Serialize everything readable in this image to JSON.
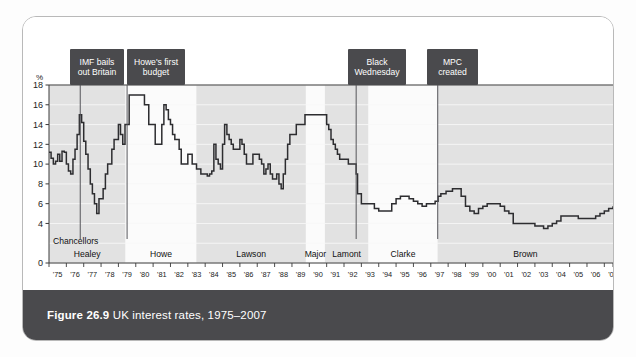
{
  "figure": {
    "number": "Figure 26.9",
    "caption": "UK interest rates, 1975–2007"
  },
  "axis": {
    "y_unit": "%",
    "y_ticks": [
      "18",
      "16",
      "14",
      "12",
      "10",
      "8",
      "6",
      "4",
      "0"
    ],
    "x_ticks": [
      "'75",
      "'76",
      "'77",
      "'78",
      "'79",
      "'80",
      "'81",
      "'82",
      "'83",
      "'84",
      "'85",
      "'86",
      "'87",
      "'88",
      "'89",
      "'90",
      "'91",
      "'92",
      "'93",
      "'94",
      "'95",
      "'96",
      "'97",
      "'98",
      "'99",
      "'00",
      "'01",
      "'02",
      "'03",
      "'04",
      "'05",
      "'06",
      "'07"
    ]
  },
  "chancellors_label": "Chancellors",
  "chancellors": [
    {
      "name": "Healey",
      "start": 1975.0,
      "end": 1979.4
    },
    {
      "name": "Howe",
      "start": 1979.4,
      "end": 1983.5
    },
    {
      "name": "Lawson",
      "start": 1983.5,
      "end": 1989.8
    },
    {
      "name": "Major",
      "start": 1989.8,
      "end": 1990.9
    },
    {
      "name": "Lamont",
      "start": 1990.9,
      "end": 1993.4
    },
    {
      "name": "Clarke",
      "start": 1993.4,
      "end": 1997.4
    },
    {
      "name": "Brown",
      "start": 1997.4,
      "end": 2007.5
    }
  ],
  "annotations": [
    {
      "text": "IMF bails\nout Britain",
      "x": 1976.8,
      "box_x": 47,
      "box_y": 32,
      "box_w": 54,
      "box_h": 36
    },
    {
      "text": "Howe's first\nbudget",
      "x": 1979.5,
      "box_x": 104,
      "box_y": 32,
      "box_w": 58,
      "box_h": 36
    },
    {
      "text": "Black\nWednesday",
      "x": 1992.7,
      "box_x": 325,
      "box_y": 32,
      "box_w": 58,
      "box_h": 36
    },
    {
      "text": "MPC\ncreated",
      "x": 1997.4,
      "box_x": 404,
      "box_y": 32,
      "box_w": 51,
      "box_h": 36
    }
  ],
  "colors": {
    "line": "#2d2d30",
    "callout_bg": "#4a4a4d",
    "caption_bg": "#4a4a4d",
    "band_light": "#fbfbfb",
    "band_dark": "#e2e2e2",
    "plot_bg": "#ebebeb",
    "grid": "#f7f7f7",
    "axis": "#3a3a3a"
  },
  "chart_data": {
    "type": "line",
    "title": "UK interest rates, 1975–2007",
    "xlabel": "",
    "ylabel": "%",
    "xlim": [
      1975.0,
      2007.5
    ],
    "ylim": [
      0,
      18
    ],
    "grid": true,
    "legend": "none",
    "step": true,
    "series": [
      {
        "name": "UK base interest rate",
        "points": [
          [
            1975.0,
            11.2
          ],
          [
            1975.12,
            10.6
          ],
          [
            1975.25,
            10.0
          ],
          [
            1975.38,
            10.3
          ],
          [
            1975.5,
            11.0
          ],
          [
            1975.62,
            10.3
          ],
          [
            1975.75,
            11.3
          ],
          [
            1975.88,
            11.2
          ],
          [
            1976.0,
            10.0
          ],
          [
            1976.12,
            9.3
          ],
          [
            1976.25,
            9.0
          ],
          [
            1976.38,
            10.5
          ],
          [
            1976.5,
            11.5
          ],
          [
            1976.62,
            13.0
          ],
          [
            1976.75,
            15.0
          ],
          [
            1976.88,
            14.2
          ],
          [
            1977.0,
            12.3
          ],
          [
            1977.12,
            11.0
          ],
          [
            1977.25,
            9.5
          ],
          [
            1977.38,
            8.0
          ],
          [
            1977.5,
            7.0
          ],
          [
            1977.62,
            6.0
          ],
          [
            1977.75,
            5.0
          ],
          [
            1977.88,
            6.5
          ],
          [
            1978.0,
            6.5
          ],
          [
            1978.12,
            7.5
          ],
          [
            1978.25,
            9.0
          ],
          [
            1978.38,
            10.0
          ],
          [
            1978.5,
            10.0
          ],
          [
            1978.62,
            11.5
          ],
          [
            1978.75,
            12.5
          ],
          [
            1978.88,
            12.5
          ],
          [
            1979.0,
            14.0
          ],
          [
            1979.12,
            13.0
          ],
          [
            1979.25,
            12.0
          ],
          [
            1979.38,
            14.0
          ],
          [
            1979.5,
            14.0
          ],
          [
            1979.62,
            17.0
          ],
          [
            1979.75,
            17.0
          ],
          [
            1979.88,
            17.0
          ],
          [
            1980.0,
            17.0
          ],
          [
            1980.25,
            17.0
          ],
          [
            1980.5,
            16.0
          ],
          [
            1980.75,
            14.0
          ],
          [
            1981.0,
            14.0
          ],
          [
            1981.12,
            12.0
          ],
          [
            1981.25,
            12.0
          ],
          [
            1981.38,
            12.0
          ],
          [
            1981.5,
            14.0
          ],
          [
            1981.62,
            16.0
          ],
          [
            1981.75,
            15.5
          ],
          [
            1981.88,
            14.5
          ],
          [
            1982.0,
            14.0
          ],
          [
            1982.12,
            13.0
          ],
          [
            1982.25,
            12.5
          ],
          [
            1982.38,
            12.5
          ],
          [
            1982.5,
            11.5
          ],
          [
            1982.62,
            10.0
          ],
          [
            1982.75,
            10.0
          ],
          [
            1982.88,
            10.0
          ],
          [
            1983.0,
            11.0
          ],
          [
            1983.25,
            10.0
          ],
          [
            1983.5,
            9.5
          ],
          [
            1983.75,
            9.0
          ],
          [
            1984.0,
            9.0
          ],
          [
            1984.12,
            8.8
          ],
          [
            1984.25,
            9.0
          ],
          [
            1984.38,
            9.3
          ],
          [
            1984.5,
            12.0
          ],
          [
            1984.62,
            10.5
          ],
          [
            1984.75,
            10.0
          ],
          [
            1984.88,
            9.5
          ],
          [
            1985.0,
            12.0
          ],
          [
            1985.12,
            14.0
          ],
          [
            1985.25,
            13.0
          ],
          [
            1985.38,
            12.5
          ],
          [
            1985.5,
            12.0
          ],
          [
            1985.62,
            11.5
          ],
          [
            1985.75,
            11.5
          ],
          [
            1985.88,
            11.5
          ],
          [
            1986.0,
            12.5
          ],
          [
            1986.12,
            12.0
          ],
          [
            1986.25,
            11.0
          ],
          [
            1986.38,
            10.0
          ],
          [
            1986.5,
            10.0
          ],
          [
            1986.62,
            10.0
          ],
          [
            1986.75,
            11.0
          ],
          [
            1986.88,
            11.0
          ],
          [
            1987.0,
            11.0
          ],
          [
            1987.12,
            10.5
          ],
          [
            1987.25,
            10.0
          ],
          [
            1987.38,
            9.0
          ],
          [
            1987.5,
            9.5
          ],
          [
            1987.62,
            10.0
          ],
          [
            1987.75,
            9.0
          ],
          [
            1987.88,
            8.5
          ],
          [
            1988.0,
            8.5
          ],
          [
            1988.12,
            9.0
          ],
          [
            1988.25,
            8.0
          ],
          [
            1988.38,
            7.5
          ],
          [
            1988.5,
            9.0
          ],
          [
            1988.62,
            10.5
          ],
          [
            1988.75,
            12.0
          ],
          [
            1988.88,
            13.0
          ],
          [
            1989.0,
            13.0
          ],
          [
            1989.25,
            14.0
          ],
          [
            1989.5,
            14.0
          ],
          [
            1989.75,
            15.0
          ],
          [
            1990.0,
            15.0
          ],
          [
            1990.25,
            15.0
          ],
          [
            1990.5,
            15.0
          ],
          [
            1990.75,
            15.0
          ],
          [
            1991.0,
            14.0
          ],
          [
            1991.12,
            13.5
          ],
          [
            1991.25,
            12.5
          ],
          [
            1991.38,
            12.0
          ],
          [
            1991.5,
            11.5
          ],
          [
            1991.62,
            11.0
          ],
          [
            1991.75,
            10.5
          ],
          [
            1991.88,
            10.5
          ],
          [
            1992.0,
            10.5
          ],
          [
            1992.25,
            10.0
          ],
          [
            1992.5,
            10.0
          ],
          [
            1992.62,
            10.0
          ],
          [
            1992.7,
            9.0
          ],
          [
            1992.78,
            7.0
          ],
          [
            1992.88,
            7.0
          ],
          [
            1993.0,
            6.0
          ],
          [
            1993.25,
            6.0
          ],
          [
            1993.5,
            6.0
          ],
          [
            1993.75,
            5.5
          ],
          [
            1994.0,
            5.25
          ],
          [
            1994.25,
            5.25
          ],
          [
            1994.5,
            5.25
          ],
          [
            1994.75,
            6.0
          ],
          [
            1995.0,
            6.5
          ],
          [
            1995.25,
            6.75
          ],
          [
            1995.5,
            6.75
          ],
          [
            1995.75,
            6.5
          ],
          [
            1996.0,
            6.25
          ],
          [
            1996.25,
            6.0
          ],
          [
            1996.5,
            5.75
          ],
          [
            1996.75,
            6.0
          ],
          [
            1997.0,
            6.0
          ],
          [
            1997.25,
            6.25
          ],
          [
            1997.42,
            6.75
          ],
          [
            1997.58,
            7.0
          ],
          [
            1997.75,
            7.0
          ],
          [
            1997.88,
            7.25
          ],
          [
            1998.0,
            7.25
          ],
          [
            1998.25,
            7.5
          ],
          [
            1998.5,
            7.5
          ],
          [
            1998.75,
            6.75
          ],
          [
            1999.0,
            5.75
          ],
          [
            1999.25,
            5.25
          ],
          [
            1999.5,
            5.0
          ],
          [
            1999.75,
            5.5
          ],
          [
            2000.0,
            5.75
          ],
          [
            2000.25,
            6.0
          ],
          [
            2000.5,
            6.0
          ],
          [
            2000.75,
            6.0
          ],
          [
            2001.0,
            5.75
          ],
          [
            2001.25,
            5.25
          ],
          [
            2001.5,
            5.0
          ],
          [
            2001.75,
            4.0
          ],
          [
            2002.0,
            4.0
          ],
          [
            2002.25,
            4.0
          ],
          [
            2002.5,
            4.0
          ],
          [
            2002.75,
            4.0
          ],
          [
            2003.0,
            3.75
          ],
          [
            2003.25,
            3.75
          ],
          [
            2003.5,
            3.5
          ],
          [
            2003.75,
            3.75
          ],
          [
            2004.0,
            4.0
          ],
          [
            2004.25,
            4.25
          ],
          [
            2004.5,
            4.75
          ],
          [
            2004.75,
            4.75
          ],
          [
            2005.0,
            4.75
          ],
          [
            2005.25,
            4.75
          ],
          [
            2005.5,
            4.5
          ],
          [
            2005.75,
            4.5
          ],
          [
            2006.0,
            4.5
          ],
          [
            2006.25,
            4.5
          ],
          [
            2006.5,
            4.75
          ],
          [
            2006.75,
            5.0
          ],
          [
            2007.0,
            5.25
          ],
          [
            2007.25,
            5.5
          ],
          [
            2007.5,
            5.75
          ]
        ]
      }
    ]
  }
}
